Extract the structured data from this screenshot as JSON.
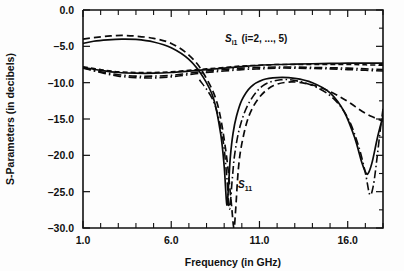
{
  "chart_data": {
    "type": "line",
    "title": "",
    "xlabel": "Frequency (in GHz)",
    "ylabel": "S-Parameters (in decibels)",
    "xlim": [
      1.0,
      18.0
    ],
    "ylim": [
      -30.0,
      0.0
    ],
    "grid": false,
    "legend_position": "inline-annotations",
    "x_major_ticks": [
      1.0,
      6.0,
      11.0,
      16.0
    ],
    "x_major_tick_labels": [
      "1.0",
      "6.0",
      "11.0",
      "16.0"
    ],
    "x_minor_ticks": [
      2.0,
      3.0,
      4.0,
      5.0,
      7.0,
      8.0,
      9.0,
      10.0,
      12.0,
      13.0,
      14.0,
      15.0,
      17.0,
      18.0
    ],
    "y_major_ticks": [
      0.0,
      -5.0,
      -10.0,
      -15.0,
      -20.0,
      -25.0,
      -30.0
    ],
    "y_major_tick_labels": [
      "0.0",
      "-5.0",
      "-10.0",
      "-15.0",
      "-20.0",
      "-25.0",
      "-30.0"
    ],
    "annotations": [
      {
        "name": "si1-group-label",
        "text_plain": "S i1 (i=2, ..., 5)",
        "x": 9.6,
        "y": -2.6
      },
      {
        "name": "s11-label",
        "text_plain": "S 11",
        "x": 10.3,
        "y": -23.0
      }
    ],
    "series": [
      {
        "name": "S11 solid",
        "style": "solid",
        "x": [
          1.0,
          1.6,
          2.4,
          3.2,
          4.0,
          5.0,
          6.0,
          7.0,
          7.8,
          8.4,
          8.8,
          9.0,
          9.15,
          9.25,
          9.35,
          9.5,
          9.7,
          10.0,
          10.5,
          11.2,
          12.0,
          13.0,
          14.0,
          15.0,
          15.8,
          16.4,
          16.8,
          17.05,
          17.2,
          17.4,
          17.7,
          18.0
        ],
        "y": [
          -4.6,
          -4.3,
          -4.1,
          -4.0,
          -4.05,
          -4.4,
          -5.2,
          -6.8,
          -9.2,
          -12.2,
          -17.0,
          -21.5,
          -26.8,
          -24.0,
          -20.2,
          -17.0,
          -14.6,
          -12.4,
          -10.6,
          -9.6,
          -9.3,
          -9.4,
          -10.0,
          -11.4,
          -14.0,
          -17.6,
          -21.0,
          -22.5,
          -22.3,
          -20.8,
          -17.4,
          -14.6
        ]
      },
      {
        "name": "S11 dashed",
        "style": "dashed",
        "x": [
          1.0,
          1.6,
          2.4,
          3.2,
          4.0,
          5.0,
          6.0,
          7.0,
          7.8,
          8.6,
          9.1,
          9.4,
          9.55,
          9.65,
          9.8,
          10.0,
          10.4,
          11.0,
          11.8,
          12.8,
          13.8,
          14.8,
          15.6,
          16.2,
          16.6,
          17.0,
          17.4,
          17.8,
          18.0
        ],
        "y": [
          -4.0,
          -3.8,
          -3.6,
          -3.5,
          -3.6,
          -3.9,
          -4.6,
          -6.2,
          -8.6,
          -12.8,
          -19.5,
          -26.5,
          -30.0,
          -27.5,
          -22.0,
          -18.4,
          -14.6,
          -12.0,
          -10.4,
          -9.9,
          -10.2,
          -11.0,
          -12.0,
          -12.9,
          -13.6,
          -14.2,
          -14.7,
          -15.1,
          -15.3
        ]
      },
      {
        "name": "Si1 solid",
        "style": "solid",
        "x": [
          1.0,
          2.0,
          3.0,
          4.0,
          5.0,
          6.0,
          7.0,
          8.0,
          9.0,
          10.0,
          11.0,
          12.0,
          13.0,
          14.0,
          15.0,
          16.0,
          17.0,
          18.0
        ],
        "y": [
          -7.9,
          -8.3,
          -8.6,
          -8.7,
          -8.7,
          -8.6,
          -8.4,
          -8.2,
          -8.0,
          -7.8,
          -7.6,
          -7.5,
          -7.45,
          -7.4,
          -7.35,
          -7.3,
          -7.3,
          -7.3
        ]
      },
      {
        "name": "Si1 dashed",
        "style": "dashed2",
        "x": [
          1.0,
          2.0,
          3.0,
          4.0,
          5.0,
          6.0,
          7.0,
          8.0,
          9.0,
          10.0,
          11.0,
          12.0,
          13.0,
          14.0,
          15.0,
          16.0,
          17.0,
          18.0
        ],
        "y": [
          -7.8,
          -8.2,
          -8.5,
          -8.6,
          -8.6,
          -8.5,
          -8.3,
          -8.1,
          -7.9,
          -7.7,
          -7.6,
          -7.5,
          -7.5,
          -7.5,
          -7.5,
          -7.5,
          -7.55,
          -7.6
        ]
      },
      {
        "name": "Si1 dashdot",
        "style": "dashdot",
        "x": [
          1.0,
          2.0,
          3.0,
          4.0,
          5.0,
          6.0,
          7.0,
          8.0,
          9.0,
          10.0,
          11.0,
          12.0,
          13.0,
          14.0,
          15.0,
          16.0,
          17.0,
          18.0
        ],
        "y": [
          -8.0,
          -8.6,
          -9.1,
          -9.3,
          -9.35,
          -9.2,
          -8.9,
          -8.6,
          -8.4,
          -8.2,
          -8.1,
          -8.0,
          -8.0,
          -8.05,
          -8.1,
          -8.2,
          -8.3,
          -8.4
        ]
      },
      {
        "name": "Si1 dashdot 2",
        "style": "dashdot",
        "x": [
          1.0,
          2.0,
          3.0,
          4.0,
          5.0,
          6.0,
          7.0,
          8.0,
          9.0,
          10.0,
          11.0,
          12.0,
          13.0,
          14.0,
          15.0,
          16.0,
          17.0,
          18.0
        ],
        "y": [
          -7.95,
          -8.5,
          -8.9,
          -9.1,
          -9.1,
          -9.0,
          -8.7,
          -8.4,
          -8.2,
          -8.0,
          -7.9,
          -7.85,
          -7.85,
          -7.9,
          -7.95,
          -8.0,
          -8.1,
          -8.2
        ]
      },
      {
        "name": "S11 dashdot resonance",
        "style": "dashdot",
        "x": [
          7.6,
          8.4,
          8.9,
          9.15,
          9.3,
          9.45,
          9.6,
          9.9,
          10.4,
          11.2,
          12.2,
          13.2,
          14.2,
          15.2,
          16.0,
          16.6,
          17.0,
          17.25,
          17.45,
          17.65,
          17.85,
          18.0
        ],
        "y": [
          -9.6,
          -12.6,
          -17.4,
          -23.0,
          -27.4,
          -23.5,
          -19.8,
          -16.0,
          -12.8,
          -10.4,
          -9.6,
          -9.8,
          -10.6,
          -12.2,
          -14.8,
          -18.6,
          -22.4,
          -25.4,
          -24.2,
          -20.6,
          -16.4,
          -13.6
        ]
      }
    ]
  },
  "axes": {
    "y_title": "S-Parameters (in decibels)",
    "x_title": "Frequency (in GHz)"
  },
  "labels": {
    "si1_main": "S",
    "si1_sub": "i1",
    "si1_paren": "(i=2, ..., 5)",
    "s11_main": "S",
    "s11_sub": "11"
  }
}
